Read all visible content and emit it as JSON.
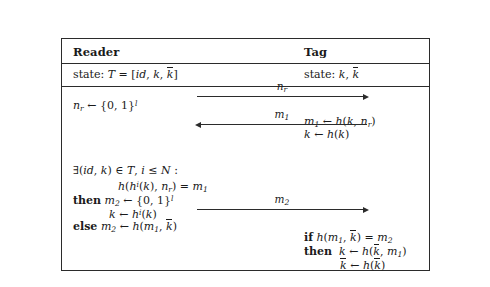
{
  "figure": {
    "columns": {
      "reader": {
        "title": "Reader",
        "state_prefix": "state:"
      },
      "tag": {
        "title": "Tag",
        "state_prefix": "state:"
      }
    },
    "reader": {
      "state_expr_T": "T",
      "state_eq": "=",
      "state_bracket_open": "[",
      "state_id": "id",
      "state_comma1": ",",
      "state_k": "k",
      "state_comma2": ",",
      "state_kbar": "k",
      "state_bracket_close": "]",
      "step1_nr": "n",
      "step1_nr_sub": "r",
      "step1_arrow": "←",
      "step1_set": "{0, 1}",
      "step1_set_sup": "l",
      "exists_sym": "∃",
      "exists_open": "(",
      "exists_id": "id",
      "exists_comma": ",",
      "exists_k": "k",
      "exists_close": ")",
      "exists_in": "∈",
      "exists_T": "T",
      "exists_comma2": ",",
      "exists_i": "i",
      "exists_le": "≤",
      "exists_N": "N",
      "exists_colon": ":",
      "cond_h": "h",
      "cond_open": "(",
      "cond_h2": "h",
      "cond_h2_sup": "i",
      "cond_open2": "(",
      "cond_k": "k",
      "cond_close2": ")",
      "cond_comma": ",",
      "cond_nr": "n",
      "cond_nr_sub": "r",
      "cond_close": ")",
      "cond_eq": "=",
      "cond_m1": "m",
      "cond_m1_sub": "1",
      "then_kw": "then",
      "then_m2": "m",
      "then_m2_sub": "2",
      "then_arrow": "←",
      "then_set": "{0, 1}",
      "then_set_sup": "l",
      "then2_k": "k",
      "then2_arrow": "←",
      "then2_h": "h",
      "then2_h_sup": "i",
      "then2_open": "(",
      "then2_kk": "k",
      "then2_close": ")",
      "else_kw": "else",
      "else_m2": "m",
      "else_m2_sub": "2",
      "else_arrow": "←",
      "else_h": "h",
      "else_open": "(",
      "else_m1": "m",
      "else_m1_sub": "1",
      "else_comma": ",",
      "else_kbar": "k",
      "else_close": ")"
    },
    "tag": {
      "state_k": "k",
      "state_comma": ",",
      "state_kbar": "k",
      "r1_m1": "m",
      "r1_m1_sub": "1",
      "r1_arrow": "←",
      "r1_h": "h",
      "r1_open": "(",
      "r1_k": "k",
      "r1_comma": ",",
      "r1_nr": "n",
      "r1_nr_sub": "r",
      "r1_close": ")",
      "r2_k": "k",
      "r2_arrow": "←",
      "r2_h": "h",
      "r2_open": "(",
      "r2_k2": "k",
      "r2_close": ")",
      "if_kw": "if",
      "if_h": "h",
      "if_open": "(",
      "if_m1": "m",
      "if_m1_sub": "1",
      "if_comma": ",",
      "if_kbar": "k",
      "if_close": ")",
      "if_eq": "=",
      "if_m2": "m",
      "if_m2_sub": "2",
      "then_kw": "then",
      "then_k": "k",
      "then_arrow": "←",
      "then_h": "h",
      "then_open": "(",
      "then_kbar": "k",
      "then_comma": ",",
      "then_m1": "m",
      "then_m1_sub": "1",
      "then_close": ")",
      "last_kbar": "k",
      "last_arrow": "←",
      "last_h": "h",
      "last_open": "(",
      "last_kbar2": "k",
      "last_close": ")"
    },
    "messages": [
      {
        "name": "n_r",
        "label_base": "n",
        "label_sub": "r",
        "direction": "right"
      },
      {
        "name": "m_1",
        "label_base": "m",
        "label_sub": "1",
        "direction": "left"
      },
      {
        "name": "m_2",
        "label_base": "m",
        "label_sub": "2",
        "direction": "right"
      }
    ],
    "colors": {
      "ink": "#1a1a1a",
      "rule": "#2b2b2b",
      "background": "#ffffff"
    }
  }
}
